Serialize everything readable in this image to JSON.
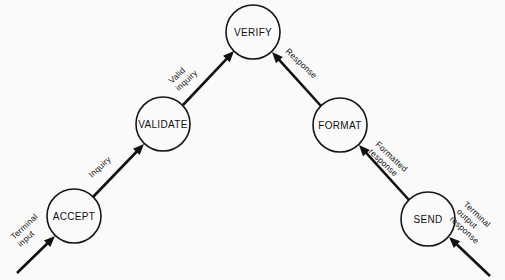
{
  "diagram": {
    "background_color": "#fbfafa",
    "stroke_color": "#111111",
    "nodes": [
      {
        "id": "accept",
        "label": "ACCEPT",
        "cx": 74,
        "cy": 216,
        "r": 27
      },
      {
        "id": "validate",
        "label": "VALIDATE",
        "cx": 163,
        "cy": 124,
        "r": 27
      },
      {
        "id": "verify",
        "label": "VERIFY",
        "cx": 253,
        "cy": 32,
        "r": 27
      },
      {
        "id": "format",
        "label": "FORMAT",
        "cx": 340,
        "cy": 125,
        "r": 27
      },
      {
        "id": "send",
        "label": "SEND",
        "cx": 428,
        "cy": 219,
        "r": 27
      }
    ],
    "edges": [
      {
        "id": "terminal-input",
        "label_lines": [
          "Terminal",
          "input"
        ],
        "from": "external-left",
        "to": "accept",
        "x1": 17,
        "y1": 273,
        "x2": 55,
        "y2": 236,
        "label_x": 14,
        "label_y": 240,
        "label_rotate": -43
      },
      {
        "id": "inquiry",
        "label_lines": [
          "Inquiry"
        ],
        "from": "accept",
        "to": "validate",
        "x1": 93,
        "y1": 197,
        "x2": 144,
        "y2": 144,
        "label_x": 92,
        "label_y": 178,
        "label_rotate": -43
      },
      {
        "id": "valid-inquiry",
        "label_lines": [
          "Valid",
          "inquiry"
        ],
        "from": "validate",
        "to": "verify",
        "x1": 183,
        "y1": 105,
        "x2": 234,
        "y2": 51,
        "label_x": 172,
        "label_y": 84,
        "label_rotate": -43
      },
      {
        "id": "response",
        "label_lines": [
          "Response"
        ],
        "from": "format",
        "to": "verify",
        "x1": 321,
        "y1": 106,
        "x2": 272,
        "y2": 52,
        "label_x": 285,
        "label_y": 52,
        "label_rotate": 43
      },
      {
        "id": "formatted-response",
        "label_lines": [
          "Formatted",
          "response"
        ],
        "from": "send",
        "to": "format",
        "x1": 409,
        "y1": 200,
        "x2": 359,
        "y2": 145,
        "label_x": 375,
        "label_y": 145,
        "label_rotate": 43
      },
      {
        "id": "terminal-output-response",
        "label_lines": [
          "Terminal",
          "output",
          "response"
        ],
        "from": "external-right",
        "to": "send",
        "x1": 490,
        "y1": 276,
        "x2": 449,
        "y2": 237,
        "label_x": 463,
        "label_y": 205,
        "label_rotate": 43
      }
    ]
  }
}
